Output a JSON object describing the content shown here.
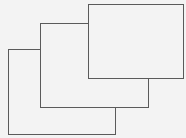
{
  "diagram": {
    "type": "cascaded-rectangles",
    "background": "#f3f3f3",
    "stroke": "#5a5a5a",
    "rectangles": [
      {
        "id": "back",
        "left": 8,
        "top": 49,
        "width": 108,
        "height": 86
      },
      {
        "id": "middle",
        "left": 40,
        "top": 23,
        "width": 109,
        "height": 85
      },
      {
        "id": "front",
        "left": 88,
        "top": 4,
        "width": 96,
        "height": 75
      }
    ]
  }
}
